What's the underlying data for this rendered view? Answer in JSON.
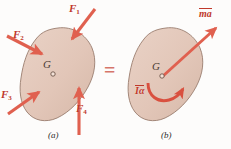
{
  "figure": {
    "panels": [
      {
        "id": "a",
        "caption": "(a)",
        "body_label": "G",
        "forces": [
          {
            "name": "F1",
            "label": "F",
            "subscript": "1"
          },
          {
            "name": "F2",
            "label": "F",
            "subscript": "2"
          },
          {
            "name": "F3",
            "label": "F",
            "subscript": "3"
          },
          {
            "name": "F4",
            "label": "F",
            "subscript": "4"
          }
        ]
      },
      {
        "id": "b",
        "caption": "(b)",
        "body_label": "G",
        "vectors": [
          {
            "name": "linear-momentum-rate",
            "label": "ma",
            "overbar": true
          },
          {
            "name": "angular-momentum-rate",
            "label": "Iα",
            "overbar": true
          }
        ]
      }
    ],
    "equals_sign": "=",
    "colors": {
      "body_fill": "#e2c6b8",
      "body_stroke": "#9a7d6e",
      "arrow": "#e0604f",
      "arrow_dark": "#c0392b",
      "label_dark": "#4a3b33",
      "background": "#fdfcfb"
    }
  }
}
